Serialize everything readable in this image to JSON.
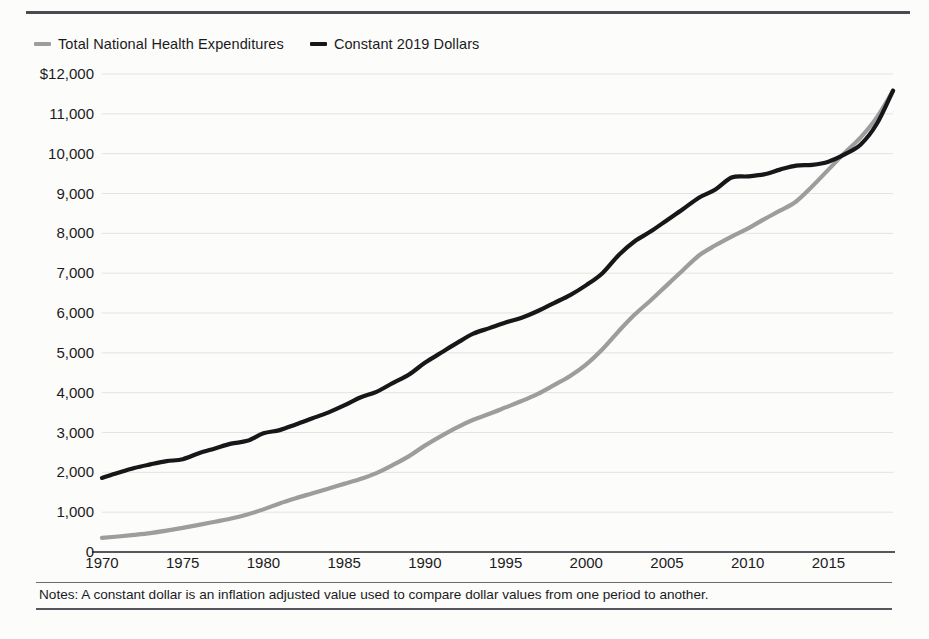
{
  "legend": {
    "items": [
      {
        "label": "Total National Health Expenditures",
        "color": "#9d9d9d",
        "key": "total"
      },
      {
        "label": "Constant 2019 Dollars",
        "color": "#17171a",
        "key": "constant"
      }
    ]
  },
  "note": "Notes: A constant dollar is an inflation adjusted value used to compare dollar values from one period to another.",
  "chart_data": {
    "type": "line",
    "title": "",
    "xlabel": "",
    "ylabel": "",
    "xlim": [
      1970,
      2019
    ],
    "ylim": [
      0,
      12000
    ],
    "grid": true,
    "legend_position": "top-left",
    "ytick_labels": [
      "$12,000",
      "11,000",
      "10,000",
      "9,000",
      "8,000",
      "7,000",
      "6,000",
      "5,000",
      "4,000",
      "3,000",
      "2,000",
      "1,000",
      "0"
    ],
    "ytick_values": [
      12000,
      11000,
      10000,
      9000,
      8000,
      7000,
      6000,
      5000,
      4000,
      3000,
      2000,
      1000,
      0
    ],
    "xtick_labels": [
      "1970",
      "1975",
      "1980",
      "1985",
      "1990",
      "1995",
      "2000",
      "2005",
      "2010",
      "2015"
    ],
    "xtick_values": [
      1970,
      1975,
      1980,
      1985,
      1990,
      1995,
      2000,
      2005,
      2010,
      2015
    ],
    "x": [
      1970,
      1971,
      1972,
      1973,
      1974,
      1975,
      1976,
      1977,
      1978,
      1979,
      1980,
      1981,
      1982,
      1983,
      1984,
      1985,
      1986,
      1987,
      1988,
      1989,
      1990,
      1991,
      1992,
      1993,
      1994,
      1995,
      1996,
      1997,
      1998,
      1999,
      2000,
      2001,
      2002,
      2003,
      2004,
      2005,
      2006,
      2007,
      2008,
      2009,
      2010,
      2011,
      2012,
      2013,
      2014,
      2015,
      2016,
      2017,
      2018,
      2019
    ],
    "series": [
      {
        "name": "Total National Health Expenditures",
        "color": "#9d9d9d",
        "values": [
          355,
          390,
          430,
          475,
          535,
          605,
          680,
          760,
          840,
          940,
          1070,
          1220,
          1350,
          1470,
          1590,
          1710,
          1830,
          1980,
          2180,
          2400,
          2670,
          2910,
          3130,
          3320,
          3470,
          3630,
          3790,
          3970,
          4190,
          4420,
          4710,
          5090,
          5540,
          5960,
          6320,
          6700,
          7080,
          7450,
          7700,
          7920,
          8120,
          8350,
          8570,
          8800,
          9180,
          9600,
          10020,
          10410,
          10910,
          11580
        ]
      },
      {
        "name": "Constant 2019 Dollars",
        "color": "#17171a",
        "values": [
          1860,
          1990,
          2110,
          2200,
          2280,
          2330,
          2480,
          2600,
          2720,
          2790,
          2980,
          3060,
          3200,
          3350,
          3500,
          3680,
          3880,
          4020,
          4240,
          4450,
          4750,
          5000,
          5250,
          5480,
          5620,
          5760,
          5880,
          6050,
          6250,
          6450,
          6700,
          7000,
          7450,
          7800,
          8050,
          8330,
          8610,
          8900,
          9100,
          9400,
          9430,
          9480,
          9600,
          9700,
          9720,
          9800,
          9980,
          10230,
          10750,
          11580
        ]
      }
    ]
  }
}
